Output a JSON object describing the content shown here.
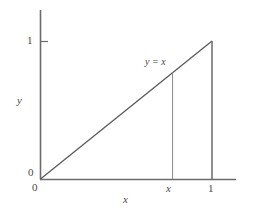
{
  "figure": {
    "kind": "line-plot",
    "background_color": "#ffffff",
    "axis_color": "#6b6b6b",
    "curve_color": "#5a5a5a",
    "dropline_color": "#8a8a8a",
    "text_color": "#4a4a4a"
  },
  "labels": {
    "y_axis_title": "y",
    "x_axis_title": "x",
    "y_tick_one": "1",
    "y_tick_zero": "0",
    "x_tick_zero": "0",
    "x_tick_x": "x",
    "x_tick_one": "1",
    "curve_equation": "y = x"
  },
  "chart_data": {
    "type": "line",
    "title": "",
    "subtitle": "",
    "xlabel": "x",
    "ylabel": "y",
    "xlim": [
      0,
      1.15
    ],
    "ylim": [
      0,
      1.18
    ],
    "grid": false,
    "legend": null,
    "legend_position": "none",
    "series": [
      {
        "name": "y = x",
        "type": "line",
        "color": "#5a5a5a",
        "x": [
          0,
          1
        ],
        "y": [
          0,
          1
        ],
        "inline_label": "y = x",
        "inline_label_at": {
          "x": 0.63,
          "y": 0.78
        }
      }
    ],
    "annotations": [
      {
        "kind": "vertical-dropline",
        "name": "dropline-at-x",
        "x": 0.77,
        "y_from": 0,
        "y_to": 0.77,
        "color": "#8a8a8a"
      },
      {
        "kind": "vertical-dropline",
        "name": "dropline-at-one",
        "x": 1.0,
        "y_from": 0,
        "y_to": 1.0,
        "color": "#6b6b6b"
      }
    ],
    "x_ticks": [
      {
        "value": 0,
        "label": "0"
      },
      {
        "value": 0.77,
        "label": "x"
      },
      {
        "value": 1.0,
        "label": "1"
      }
    ],
    "y_ticks": [
      {
        "value": 0,
        "label": "0"
      },
      {
        "value": 1.0,
        "label": "1"
      }
    ],
    "axis_style": "open-l-frame-with-arrowless-spines"
  }
}
